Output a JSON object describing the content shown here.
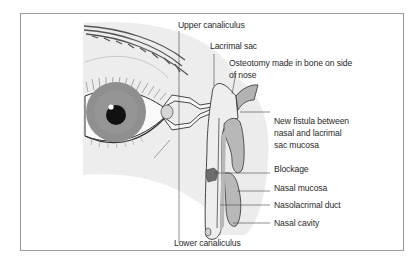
{
  "figure": {
    "type": "anatomical-diagram",
    "colors": {
      "skin_shade": "#ececec",
      "iris": "#8f8f8f",
      "pupil": "#111111",
      "mucosa": "#b8b8b8",
      "blockage": "#6e6e6e",
      "outline": "#333333",
      "frame": "#9a9a9a"
    },
    "labels": {
      "upper_canaliculus": "Upper canaliculus",
      "lacrimal_sac": "Lacrimal sac",
      "osteotomy_line1": "Osteotomy made in bone on side",
      "osteotomy_line2": "of nose",
      "new_fistula_line1": "New fistula between",
      "new_fistula_line2": "nasal and lacrimal",
      "new_fistula_line3": "sac mucosa",
      "blockage": "Blockage",
      "nasal_mucosa": "Nasal mucosa",
      "nasolacrimal_duct": "Nasolacrimal duct",
      "nasal_cavity": "Nasal cavity",
      "lower_canaliculus": "Lower canaliculus"
    }
  }
}
